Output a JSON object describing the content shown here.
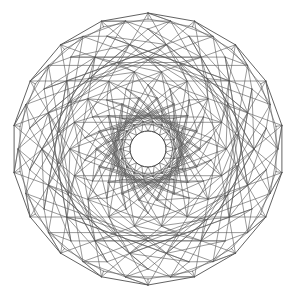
{
  "figure": {
    "description": "Orthogonal projection wireframe of a polytope with 18-fold rotational symmetry",
    "symmetry": 18,
    "center": [
      148,
      149
    ],
    "outer_radius": 136,
    "inner_hole_radius": 18,
    "line_color": "#3a3a3a",
    "background": "#ffffff",
    "rings": [
      18,
      28,
      40,
      52,
      64,
      78,
      92,
      106,
      120,
      130,
      136
    ]
  }
}
